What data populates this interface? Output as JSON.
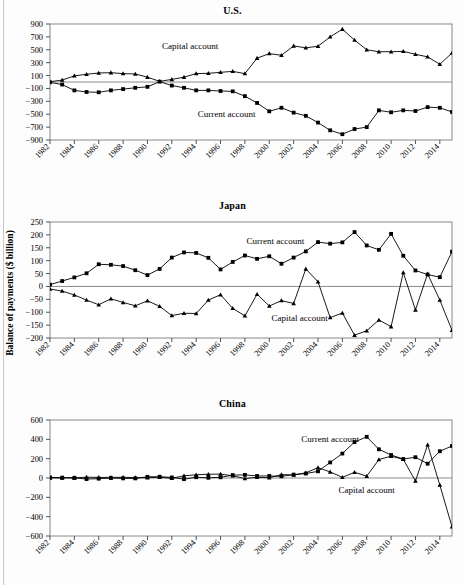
{
  "figure": {
    "y_axis_title": "Balance of payments ($ billion)",
    "series_names": {
      "current": "Current account",
      "capital": "Capital account"
    }
  },
  "chart_data": [
    {
      "type": "line",
      "title": "U.S.",
      "xlabel": "",
      "ylabel": "Balance of payments ($ billion)",
      "ylim": [
        -900,
        900
      ],
      "ytick_values": [
        -900,
        -700,
        -500,
        -300,
        -100,
        100,
        300,
        500,
        700,
        900
      ],
      "ytick_labels": [
        "−900",
        "−700",
        "−500",
        "−300",
        "−100",
        "100",
        "300",
        "500",
        "700",
        "900"
      ],
      "xlim": [
        1982,
        2015
      ],
      "xtick_values": [
        1982,
        1984,
        1986,
        1988,
        1990,
        1992,
        1994,
        1996,
        1998,
        2000,
        2002,
        2004,
        2006,
        2008,
        2010,
        2012,
        2014
      ],
      "xtick_labels": [
        "1982",
        "1984",
        "1986",
        "1988",
        "1990",
        "1992",
        "1994",
        "1996",
        "1998",
        "2000",
        "2002",
        "2004",
        "2006",
        "2008",
        "2010",
        "2012",
        "2014"
      ],
      "grid": false,
      "legend_position": "inline-annotation",
      "x": [
        1982,
        1983,
        1984,
        1985,
        1986,
        1987,
        1988,
        1989,
        1990,
        1991,
        1992,
        1993,
        1994,
        1995,
        1996,
        1997,
        1998,
        1999,
        2000,
        2001,
        2002,
        2003,
        2004,
        2005,
        2006,
        2007,
        2008,
        2009,
        2010,
        2011,
        2012,
        2013,
        2014,
        2015
      ],
      "series": [
        {
          "name": "Capital account",
          "marker": "triangle",
          "label_x": 1993.5,
          "label_y": 560,
          "values": [
            5,
            30,
            95,
            120,
            140,
            145,
            130,
            125,
            75,
            10,
            40,
            75,
            130,
            135,
            150,
            165,
            130,
            370,
            440,
            415,
            560,
            530,
            555,
            700,
            820,
            650,
            500,
            470,
            470,
            475,
            430,
            390,
            275,
            450
          ]
        },
        {
          "name": "Current account",
          "marker": "square",
          "label_x": 1996.5,
          "label_y": -500,
          "values": [
            -5,
            -40,
            -130,
            -155,
            -160,
            -130,
            -110,
            -90,
            -75,
            5,
            -55,
            -90,
            -130,
            -130,
            -140,
            -145,
            -220,
            -325,
            -455,
            -400,
            -475,
            -525,
            -630,
            -750,
            -810,
            -730,
            -700,
            -440,
            -470,
            -440,
            -450,
            -390,
            -400,
            -465
          ]
        }
      ]
    },
    {
      "type": "line",
      "title": "Japan",
      "xlabel": "",
      "ylabel": "Balance of payments ($ billion)",
      "ylim": [
        -200,
        250
      ],
      "ytick_values": [
        -200,
        -150,
        -100,
        -50,
        0,
        50,
        100,
        150,
        200,
        250
      ],
      "ytick_labels": [
        "−200",
        "−150",
        "−100",
        "−50",
        "0",
        "50",
        "100",
        "150",
        "200",
        "250"
      ],
      "xlim": [
        1982,
        2015
      ],
      "xtick_values": [
        1982,
        1984,
        1986,
        1988,
        1990,
        1992,
        1994,
        1996,
        1998,
        2000,
        2002,
        2004,
        2006,
        2008,
        2010,
        2012,
        2014
      ],
      "xtick_labels": [
        "1982",
        "1984",
        "1986",
        "1988",
        "1990",
        "1992",
        "1994",
        "1996",
        "1998",
        "2000",
        "2002",
        "2004",
        "2006",
        "2008",
        "2010",
        "2012",
        "2014"
      ],
      "grid": false,
      "legend_position": "inline-annotation",
      "x": [
        1982,
        1983,
        1984,
        1985,
        1986,
        1987,
        1988,
        1989,
        1990,
        1991,
        1992,
        1993,
        1994,
        1995,
        1996,
        1997,
        1998,
        1999,
        2000,
        2001,
        2002,
        2003,
        2004,
        2005,
        2006,
        2007,
        2008,
        2009,
        2010,
        2011,
        2012,
        2013,
        2014,
        2015
      ],
      "series": [
        {
          "name": "Current account",
          "marker": "square",
          "label_x": 2000.5,
          "label_y": 175,
          "values": [
            7,
            21,
            35,
            51,
            86,
            84,
            79,
            63,
            44,
            68,
            112,
            132,
            130,
            111,
            66,
            95,
            120,
            107,
            117,
            88,
            112,
            136,
            172,
            166,
            171,
            211,
            159,
            142,
            204,
            119,
            62,
            46,
            36,
            135
          ]
        },
        {
          "name": "Capital account",
          "marker": "triangle",
          "label_x": 2002.5,
          "label_y": -122,
          "values": [
            -10,
            -18,
            -33,
            -53,
            -71,
            -48,
            -62,
            -75,
            -56,
            -77,
            -113,
            -104,
            -105,
            -53,
            -32,
            -85,
            -114,
            -30,
            -76,
            -55,
            -66,
            68,
            18,
            -121,
            -103,
            -189,
            -172,
            -130,
            -156,
            54,
            -91,
            49,
            -53,
            -170
          ]
        }
      ]
    },
    {
      "type": "line",
      "title": "China",
      "xlabel": "",
      "ylabel": "Balance of payments ($ billion)",
      "ylim": [
        -600,
        600
      ],
      "ytick_values": [
        -600,
        -400,
        -200,
        0,
        200,
        400,
        600
      ],
      "ytick_labels": [
        "−600",
        "−400",
        "−200",
        "0",
        "200",
        "400",
        "600"
      ],
      "xlim": [
        1982,
        2015
      ],
      "xtick_values": [
        1982,
        1984,
        1986,
        1988,
        1990,
        1992,
        1994,
        1996,
        1998,
        2000,
        2002,
        2004,
        2006,
        2008,
        2010,
        2012,
        2014
      ],
      "xtick_labels": [
        "1982",
        "1984",
        "1986",
        "1988",
        "1990",
        "1992",
        "1994",
        "1996",
        "1998",
        "2000",
        "2002",
        "2004",
        "2006",
        "2008",
        "2010",
        "2012",
        "2014"
      ],
      "grid": false,
      "legend_position": "inline-annotation",
      "x": [
        1982,
        1983,
        1984,
        1985,
        1986,
        1987,
        1988,
        1989,
        1990,
        1991,
        1992,
        1993,
        1994,
        1995,
        1996,
        1997,
        1998,
        1999,
        2000,
        2001,
        2002,
        2003,
        2004,
        2005,
        2006,
        2007,
        2008,
        2009,
        2010,
        2011,
        2012,
        2013,
        2014,
        2015
      ],
      "series": [
        {
          "name": "Current account",
          "marker": "square",
          "label_x": 2005.0,
          "label_y": 400,
          "values": [
            6,
            4,
            2,
            -11,
            -7,
            0,
            -4,
            -4,
            12,
            13,
            6,
            -12,
            8,
            2,
            7,
            30,
            32,
            21,
            21,
            17,
            35,
            46,
            69,
            161,
            253,
            372,
            426,
            297,
            238,
            196,
            215,
            148,
            277,
            331
          ]
        },
        {
          "name": "Capital account",
          "marker": "triangle",
          "label_x": 2008.0,
          "label_y": -120,
          "values": [
            1,
            1,
            1,
            9,
            6,
            6,
            7,
            4,
            3,
            8,
            -3,
            23,
            33,
            39,
            40,
            23,
            -6,
            8,
            2,
            35,
            32,
            53,
            107,
            63,
            7,
            59,
            19,
            191,
            226,
            193,
            -32,
            343,
            -73,
            -504
          ]
        }
      ]
    }
  ]
}
